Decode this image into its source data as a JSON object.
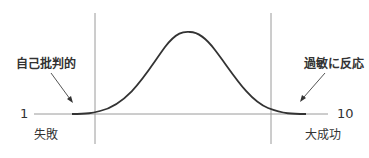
{
  "diagram": {
    "type": "bell-curve",
    "axis": {
      "min_label": "1",
      "max_label": "10",
      "min_caption": "失敗",
      "max_caption": "大成功"
    },
    "annotations": {
      "left": "自己批判的",
      "right": "過敏に反応"
    },
    "colors": {
      "curve": "#333333",
      "axis": "#9a9a9a",
      "text": "#333333"
    }
  }
}
